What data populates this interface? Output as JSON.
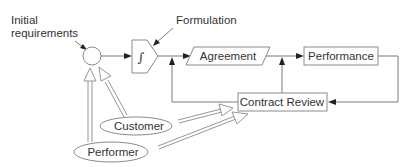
{
  "diagram": {
    "type": "process-flow",
    "labels": {
      "initial_requirements_line1": "Initial",
      "initial_requirements_line2": "requirements",
      "formulation": "Formulation",
      "integral_symbol": "∫"
    },
    "nodes": {
      "junction": {
        "shape": "circle",
        "label": ""
      },
      "formulation_block": {
        "shape": "integrator-pentagon",
        "label": "∫"
      },
      "agreement": {
        "shape": "parallelogram",
        "label": "Agreement"
      },
      "performance": {
        "shape": "rectangle",
        "label": "Performance"
      },
      "contract_review": {
        "shape": "rectangle",
        "label": "Contract Review"
      },
      "customer": {
        "shape": "ellipse",
        "label": "Customer"
      },
      "performer": {
        "shape": "ellipse",
        "label": "Performer"
      }
    },
    "edges": [
      {
        "from": "Initial requirements",
        "to": "junction",
        "style": "thin-arrow"
      },
      {
        "from": "Formulation",
        "to": "formulation_block",
        "style": "thin-arrow"
      },
      {
        "from": "junction",
        "to": "formulation_block",
        "style": "arrow"
      },
      {
        "from": "formulation_block",
        "to": "agreement",
        "style": "arrow"
      },
      {
        "from": "agreement",
        "to": "performance",
        "style": "arrow"
      },
      {
        "from": "performance",
        "to": "contract_review",
        "style": "arrow"
      },
      {
        "from": "contract_review",
        "to": "formulation_block-output",
        "style": "arrow"
      },
      {
        "from": "contract_review",
        "to": "agreement-output",
        "style": "arrow"
      },
      {
        "from": "customer",
        "to": "junction",
        "style": "hollow-arrow"
      },
      {
        "from": "performer",
        "to": "junction",
        "style": "hollow-arrow"
      },
      {
        "from": "customer",
        "to": "contract_review",
        "style": "hollow-arrow"
      },
      {
        "from": "performer",
        "to": "contract_review",
        "style": "hollow-arrow"
      }
    ]
  }
}
